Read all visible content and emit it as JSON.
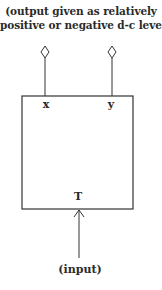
{
  "diagram": {
    "caption_lines": [
      "(output given as relatively",
      "positive or negative d-c level)"
    ],
    "block": {
      "name": "T",
      "outputs": [
        {
          "id": "x",
          "label": "x",
          "terminal": "diamond"
        },
        {
          "id": "y",
          "label": "y",
          "terminal": "diamond"
        }
      ]
    },
    "input_label": "(input)",
    "colors": {
      "stroke": "#333333",
      "text": "#2a2a2a",
      "background": "#ffffff"
    }
  }
}
